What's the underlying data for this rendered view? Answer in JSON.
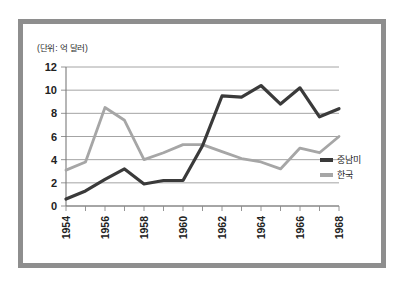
{
  "figure": {
    "unit_label": "(단위: 억 달러)",
    "frame_color": "#8e8e8e",
    "background": "#ffffff"
  },
  "legend": {
    "position": "right",
    "entries": [
      {
        "label": "중남미",
        "color": "#3a3a3a"
      },
      {
        "label": "한국",
        "color": "#a6a6a6"
      }
    ]
  },
  "chart_data": {
    "type": "line",
    "title": "",
    "subtitle": "",
    "xlabel": "",
    "ylabel": "",
    "unit": "억 달러",
    "grid": true,
    "legend_position": "right",
    "x": [
      1954,
      1955,
      1956,
      1957,
      1958,
      1959,
      1960,
      1961,
      1962,
      1963,
      1964,
      1965,
      1966,
      1967,
      1968
    ],
    "xlim": [
      1954,
      1968
    ],
    "xtick_labels": [
      "1954",
      "1956",
      "1958",
      "1960",
      "1962",
      "1964",
      "1966",
      "1968"
    ],
    "xtick_values": [
      1954,
      1956,
      1958,
      1960,
      1962,
      1964,
      1966,
      1968
    ],
    "ylim": [
      0,
      12
    ],
    "ytick_labels": [
      "0",
      "2",
      "4",
      "6",
      "8",
      "10",
      "12"
    ],
    "ytick_values": [
      0,
      2,
      4,
      6,
      8,
      10,
      12
    ],
    "series": [
      {
        "name": "중남미",
        "color": "#3a3a3a",
        "linewidth": 3.2,
        "values": [
          0.6,
          1.3,
          2.3,
          3.2,
          1.9,
          2.2,
          2.2,
          5.2,
          9.5,
          9.4,
          10.4,
          8.8,
          10.2,
          7.7,
          8.4
        ]
      },
      {
        "name": "한국",
        "color": "#a6a6a6",
        "linewidth": 2.8,
        "values": [
          3.1,
          3.8,
          8.5,
          7.4,
          4.0,
          4.6,
          5.3,
          5.3,
          4.7,
          4.1,
          3.8,
          3.2,
          5.0,
          4.6,
          6.0
        ]
      }
    ]
  }
}
